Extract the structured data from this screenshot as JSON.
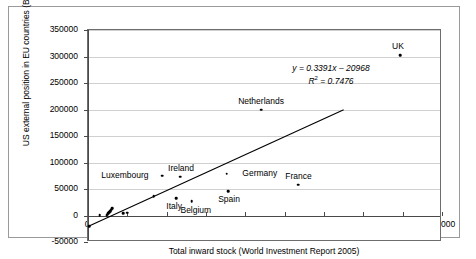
{
  "chart_data": {
    "type": "scatter",
    "title": "",
    "xlabel": "Total inward stock (World Investment Report 2005)",
    "ylabel": "US external position in EU countries (BEA 2005)",
    "xlim": [
      0,
      900000
    ],
    "ylim": [
      -50000,
      350000
    ],
    "grid": true,
    "legend": "none",
    "xticks": [
      0,
      100000,
      200000,
      300000,
      400000,
      500000,
      600000,
      700000,
      800000,
      900000
    ],
    "xtick_labels": [
      "0",
      "100000",
      "200000",
      "300000",
      "400000",
      "500000",
      "600000",
      "700000",
      "800000",
      "900000"
    ],
    "yticks": [
      -50000,
      0,
      50000,
      100000,
      150000,
      200000,
      250000,
      300000,
      350000
    ],
    "ytick_labels": [
      "-50000",
      "0",
      "50000",
      "100000",
      "150000",
      "200000",
      "250000",
      "300000",
      "350000"
    ],
    "points": [
      {
        "label": "UK",
        "x": 793000,
        "y": 303000,
        "label_dx": -2,
        "label_dy": -13,
        "labelled": true
      },
      {
        "label": "Netherlands",
        "x": 440000,
        "y": 200000,
        "label_dx": 0,
        "label_dy": -13,
        "labelled": true
      },
      {
        "label": "Germany",
        "x": 353000,
        "y": 79000,
        "label_dx": 33,
        "label_dy": -5,
        "labelled": true
      },
      {
        "label": "Ireland",
        "x": 234000,
        "y": 73000,
        "label_dx": 1,
        "label_dy": -13,
        "labelled": true
      },
      {
        "label": "Luxembourg",
        "x": 188000,
        "y": 75000,
        "label_dx": -37,
        "label_dy": -5,
        "labelled": true
      },
      {
        "label": "France",
        "x": 535000,
        "y": 58000,
        "label_dx": 0,
        "label_dy": -13,
        "labelled": true
      },
      {
        "label": "Spain",
        "x": 356000,
        "y": 46000,
        "label_dx": 1,
        "label_dy": 4,
        "labelled": true
      },
      {
        "label": "Italy",
        "x": 224000,
        "y": 33000,
        "label_dx": -2,
        "label_dy": 4,
        "labelled": true
      },
      {
        "label": "Belgium",
        "x": 264000,
        "y": 27000,
        "label_dx": 4,
        "label_dy": 5,
        "labelled": true
      },
      {
        "label": "",
        "x": 167000,
        "y": 36000,
        "labelled": false
      },
      {
        "label": "",
        "x": 99000,
        "y": 5000,
        "labelled": false
      },
      {
        "label": "",
        "x": 90000,
        "y": 4000,
        "labelled": false
      },
      {
        "label": "",
        "x": 30000,
        "y": 1000,
        "labelled": false
      },
      {
        "label": "",
        "x": 62000,
        "y": 14000,
        "labelled": false
      },
      {
        "label": "",
        "x": 60000,
        "y": 12000,
        "labelled": false
      },
      {
        "label": "",
        "x": 58000,
        "y": 10000,
        "labelled": false
      },
      {
        "label": "",
        "x": 56000,
        "y": 8000,
        "labelled": false
      },
      {
        "label": "",
        "x": 54000,
        "y": 6000,
        "labelled": false
      },
      {
        "label": "",
        "x": 52000,
        "y": 4000,
        "labelled": false
      },
      {
        "label": "",
        "x": 50000,
        "y": 2000,
        "labelled": false
      },
      {
        "label": "",
        "x": 48000,
        "y": 1000,
        "labelled": false
      },
      {
        "label": "",
        "x": 3000,
        "y": -20000,
        "labelled": false
      }
    ],
    "trendline": {
      "slope": 0.3391,
      "intercept": -20968,
      "r_squared": 0.7476,
      "equation_text": "y = 0.3391x – 20968",
      "r2_label": "R",
      "r2_sup": "2",
      "r2_value": "= 0.7476",
      "x_start": 0,
      "x_end": 650000
    }
  }
}
